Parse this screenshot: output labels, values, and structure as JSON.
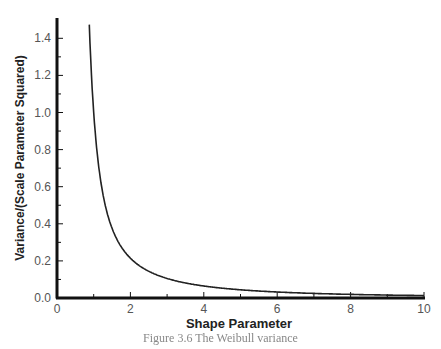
{
  "chart_data": {
    "type": "line",
    "title": "",
    "xlabel": "Shape Parameter",
    "ylabel": "Variance/(Scale Parameter Squared)",
    "xlim": [
      0,
      10
    ],
    "ylim": [
      0,
      1.5
    ],
    "x_ticks": [
      "0",
      "2",
      "4",
      "6",
      "8",
      "10"
    ],
    "y_ticks": [
      "0.0",
      "0.2",
      "0.4",
      "0.6",
      "0.8",
      "1.0",
      "1.2",
      "1.4"
    ],
    "grid": false,
    "legend": null,
    "series": [
      {
        "name": "Weibull variance / scale²",
        "x": [
          0.85,
          0.9,
          1.0,
          1.25,
          1.5,
          2,
          2.5,
          3,
          4,
          5,
          6,
          7,
          8,
          9,
          10
        ],
        "values": [
          1.55,
          1.38,
          1.0,
          0.6,
          0.376,
          0.215,
          0.144,
          0.105,
          0.064,
          0.043,
          0.031,
          0.023,
          0.0185,
          0.015,
          0.0123
        ]
      }
    ],
    "caption": "Figure 3.6 The Weibull variance"
  }
}
